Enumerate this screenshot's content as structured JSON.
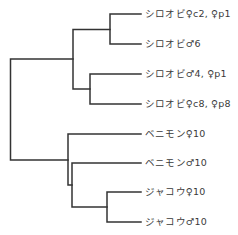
{
  "diagram": {
    "type": "dendrogram",
    "line_color": "#333333",
    "text_color": "#3a3a3a",
    "leaves": [
      {
        "label": "シロオビ♀c2, ♀p1",
        "y": 14
      },
      {
        "label": "シロオビ♂6",
        "y": 44
      },
      {
        "label": "シロオビ♂4, ♀p1",
        "y": 74
      },
      {
        "label": "シロオビ♀c8, ♀p8",
        "y": 104
      },
      {
        "label": "ベニモン♀10",
        "y": 134
      },
      {
        "label": "ベニモン♂10",
        "y": 163
      },
      {
        "label": "ジャコウ♀10",
        "y": 192
      },
      {
        "label": "ジャコウ♂10",
        "y": 222
      }
    ],
    "clades": [
      {
        "name": "clade-shirobi-1",
        "members": [
          "シロオビ♀c2, ♀p1",
          "シロオビ♂6"
        ]
      },
      {
        "name": "clade-shirobi-2",
        "members": [
          "シロオビ♂4, ♀p1",
          "シロオビ♀c8, ♀p8"
        ]
      },
      {
        "name": "clade-shirobi",
        "members": [
          "clade-shirobi-1",
          "clade-shirobi-2"
        ]
      },
      {
        "name": "clade-jakou",
        "members": [
          "ジャコウ♀10",
          "ジャコウ♂10"
        ]
      },
      {
        "name": "clade-benimon-jakou-inner",
        "members": [
          "ベニモン♂10",
          "clade-jakou"
        ]
      },
      {
        "name": "clade-benimon-jakou",
        "members": [
          "ベニモン♀10",
          "clade-benimon-jakou-inner"
        ]
      },
      {
        "name": "root",
        "members": [
          "clade-shirobi",
          "clade-benimon-jakou"
        ]
      }
    ]
  }
}
